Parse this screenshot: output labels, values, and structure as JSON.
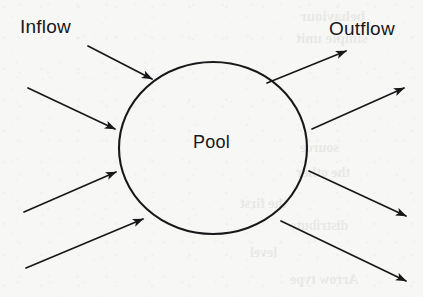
{
  "diagram": {
    "background_color": "#f7f7f5",
    "ink_color": "#17181a",
    "labels": {
      "inflow": "Inflow",
      "outflow": "Outflow",
      "pool": "Pool"
    },
    "pool_shape": {
      "name": "pool-circle",
      "center_x": 213,
      "center_y": 148,
      "radius_x": 94,
      "radius_y": 86,
      "stroke_width": 2,
      "fill": "none"
    },
    "inflow_arrows": [
      {
        "name": "inflow-arrow-1",
        "x1": 88,
        "y1": 46,
        "x2": 152,
        "y2": 79
      },
      {
        "name": "inflow-arrow-2",
        "x1": 28,
        "y1": 88,
        "x2": 115,
        "y2": 129
      },
      {
        "name": "inflow-arrow-3",
        "x1": 24,
        "y1": 212,
        "x2": 116,
        "y2": 172
      },
      {
        "name": "inflow-arrow-4",
        "x1": 26,
        "y1": 268,
        "x2": 143,
        "y2": 219
      }
    ],
    "outflow_arrows": [
      {
        "name": "outflow-arrow-1",
        "x1": 267,
        "y1": 83,
        "x2": 346,
        "y2": 51
      },
      {
        "name": "outflow-arrow-2",
        "x1": 312,
        "y1": 129,
        "x2": 404,
        "y2": 88
      },
      {
        "name": "outflow-arrow-3",
        "x1": 309,
        "y1": 171,
        "x2": 406,
        "y2": 216
      },
      {
        "name": "outflow-arrow-4",
        "x1": 281,
        "y1": 221,
        "x2": 406,
        "y2": 281
      }
    ],
    "bleed_through_text": [
      {
        "text": "behaviour",
        "x": 300,
        "y": 8,
        "size": 15
      },
      {
        "text": "simple unit",
        "x": 296,
        "y": 30,
        "size": 15
      },
      {
        "text": "source",
        "x": 300,
        "y": 140,
        "size": 14
      },
      {
        "text": "the other",
        "x": 296,
        "y": 165,
        "size": 14
      },
      {
        "text": "the first",
        "x": 240,
        "y": 196,
        "size": 14
      },
      {
        "text": "distribute",
        "x": 290,
        "y": 218,
        "size": 14
      },
      {
        "text": "level",
        "x": 250,
        "y": 245,
        "size": 14
      },
      {
        "text": "Arrow type",
        "x": 290,
        "y": 272,
        "size": 14
      }
    ]
  }
}
